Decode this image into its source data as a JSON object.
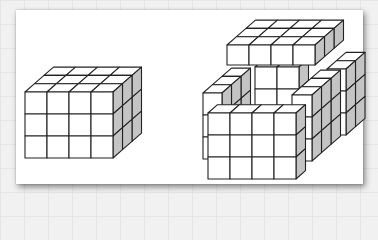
{
  "figure": {
    "colors": {
      "front": "#ffffff",
      "top": "#ffffff",
      "side": "#c4c4c4",
      "stroke": "#222222",
      "card": "#ffffff"
    },
    "cell": 22,
    "depth_step": {
      "dx": 9.5,
      "dy": -8.3
    }
  },
  "solids": [
    {
      "name": "left-solid-block",
      "x": 25,
      "y": 92,
      "cols": 4,
      "rows": 3,
      "depth": 3
    },
    {
      "name": "right-back-column",
      "x": 327,
      "y": 69,
      "cols": 1,
      "rows": 3,
      "depth": 2,
      "cw": 19,
      "ch": 22
    },
    {
      "name": "right-center-core",
      "x": 255,
      "y": 67,
      "cols": 2,
      "rows": 2,
      "depth": 1,
      "cw": 22,
      "ch": 22
    },
    {
      "name": "right-top-slab",
      "x": 227,
      "y": 45,
      "cols": 4,
      "rows": 1,
      "depth": 3,
      "cw": 22,
      "ch": 20
    },
    {
      "name": "right-left-column",
      "x": 203,
      "y": 93,
      "cols": 1,
      "rows": 3,
      "depth": 3,
      "cw": 19,
      "ch": 22
    },
    {
      "name": "right-right-tower",
      "x": 292,
      "y": 95,
      "cols": 1,
      "rows": 3,
      "depth": 3,
      "cw": 20,
      "ch": 22
    },
    {
      "name": "right-front-slab",
      "x": 208,
      "y": 113,
      "cols": 4,
      "rows": 3,
      "depth": 1,
      "cw": 22,
      "ch": 22
    }
  ]
}
